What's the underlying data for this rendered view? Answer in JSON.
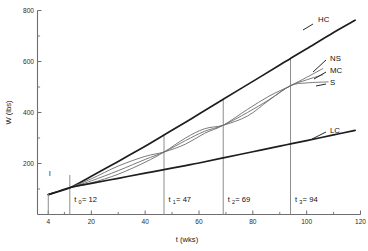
{
  "chart_data": {
    "type": "line",
    "title": "",
    "xlabel": "t (wks)",
    "ylabel": "W (lbs)",
    "xlim": [
      0,
      120
    ],
    "ylim": [
      0,
      800
    ],
    "grid": false,
    "legend_position": "right-of-curve-ends",
    "x_ticks": [
      4,
      20,
      40,
      60,
      80,
      100,
      120
    ],
    "x_tick_labels": [
      "4",
      "20",
      "40",
      "60",
      "80",
      "100",
      "120"
    ],
    "x_minor_ticks": [
      10,
      30,
      50,
      70,
      90,
      110
    ],
    "y_ticks": [
      200,
      400,
      600,
      800
    ],
    "y_tick_labels": [
      "200",
      "400",
      "600",
      "800"
    ],
    "y_minor_ticks": [
      100,
      300,
      500,
      700
    ],
    "origin_point": {
      "t": 12,
      "W": 105
    },
    "series": [
      {
        "name": "HC",
        "label": "HC",
        "style": "heavy",
        "points": [
          {
            "t": 4,
            "W": 78
          },
          {
            "t": 12,
            "W": 105
          },
          {
            "t": 20,
            "W": 150
          },
          {
            "t": 30,
            "W": 208
          },
          {
            "t": 40,
            "W": 268
          },
          {
            "t": 47,
            "W": 312
          },
          {
            "t": 55,
            "W": 362
          },
          {
            "t": 60,
            "W": 394
          },
          {
            "t": 69,
            "W": 452
          },
          {
            "t": 80,
            "W": 522
          },
          {
            "t": 90,
            "W": 586
          },
          {
            "t": 94,
            "W": 612
          },
          {
            "t": 100,
            "W": 650
          },
          {
            "t": 110,
            "W": 714
          },
          {
            "t": 118,
            "W": 762
          }
        ]
      },
      {
        "name": "NS",
        "label": "NS",
        "style": "light",
        "points": [
          {
            "t": 12,
            "W": 105
          },
          {
            "t": 20,
            "W": 140
          },
          {
            "t": 30,
            "W": 190
          },
          {
            "t": 40,
            "W": 228
          },
          {
            "t": 47,
            "W": 245
          },
          {
            "t": 55,
            "W": 276
          },
          {
            "t": 62,
            "W": 318
          },
          {
            "t": 69,
            "W": 350
          },
          {
            "t": 78,
            "W": 412
          },
          {
            "t": 86,
            "W": 464
          },
          {
            "t": 94,
            "W": 505
          },
          {
            "t": 100,
            "W": 538
          },
          {
            "t": 106,
            "W": 572
          }
        ]
      },
      {
        "name": "MC",
        "label": "MC",
        "style": "light",
        "points": [
          {
            "t": 12,
            "W": 105
          },
          {
            "t": 20,
            "W": 132
          },
          {
            "t": 30,
            "W": 172
          },
          {
            "t": 40,
            "W": 216
          },
          {
            "t": 47,
            "W": 245
          },
          {
            "t": 55,
            "W": 290
          },
          {
            "t": 62,
            "W": 326
          },
          {
            "t": 69,
            "W": 350
          },
          {
            "t": 78,
            "W": 400
          },
          {
            "t": 86,
            "W": 450
          },
          {
            "t": 94,
            "W": 505
          },
          {
            "t": 100,
            "W": 528
          },
          {
            "t": 106,
            "W": 548
          }
        ]
      },
      {
        "name": "S",
        "label": "S",
        "style": "light",
        "points": [
          {
            "t": 12,
            "W": 105
          },
          {
            "t": 20,
            "W": 124
          },
          {
            "t": 30,
            "W": 158
          },
          {
            "t": 40,
            "W": 205
          },
          {
            "t": 47,
            "W": 245
          },
          {
            "t": 55,
            "W": 300
          },
          {
            "t": 62,
            "W": 336
          },
          {
            "t": 69,
            "W": 350
          },
          {
            "t": 78,
            "W": 386
          },
          {
            "t": 86,
            "W": 448
          },
          {
            "t": 94,
            "W": 505
          },
          {
            "t": 100,
            "W": 516
          },
          {
            "t": 108,
            "W": 520
          }
        ]
      },
      {
        "name": "LC",
        "label": "LC",
        "style": "heavy",
        "points": [
          {
            "t": 4,
            "W": 78
          },
          {
            "t": 12,
            "W": 105
          },
          {
            "t": 20,
            "W": 122
          },
          {
            "t": 30,
            "W": 142
          },
          {
            "t": 40,
            "W": 162
          },
          {
            "t": 47,
            "W": 176
          },
          {
            "t": 55,
            "W": 192
          },
          {
            "t": 60,
            "W": 202
          },
          {
            "t": 69,
            "W": 222
          },
          {
            "t": 80,
            "W": 246
          },
          {
            "t": 90,
            "W": 268
          },
          {
            "t": 94,
            "W": 277
          },
          {
            "t": 100,
            "W": 290
          },
          {
            "t": 110,
            "W": 312
          },
          {
            "t": 118,
            "W": 330
          }
        ]
      }
    ],
    "vertical_markers": [
      {
        "key": "t0",
        "t": 12,
        "label_main": "t",
        "label_sub": "0",
        "label_value": "= 12",
        "top_W": 155
      },
      {
        "key": "t1",
        "t": 47,
        "label_main": "t",
        "label_sub": "1",
        "label_value": "= 47",
        "top_W": 312
      },
      {
        "key": "t2",
        "t": 69,
        "label_main": "t",
        "label_sub": "2",
        "label_value": "= 69",
        "top_W": 452
      },
      {
        "key": "t3",
        "t": 94,
        "label_main": "t",
        "label_sub": "3",
        "label_value": "= 94",
        "top_W": 612
      }
    ],
    "annotations": [
      {
        "key": "initial-marker",
        "text": "I",
        "t": 4,
        "W": 150
      }
    ]
  }
}
